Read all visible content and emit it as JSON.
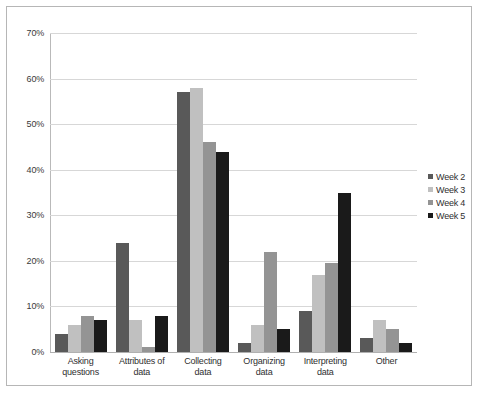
{
  "chart_data": {
    "type": "bar",
    "title": "",
    "xlabel": "",
    "ylabel": "",
    "ylim": [
      0,
      70
    ],
    "ytick_labels": [
      "70%",
      "60%",
      "50%",
      "40%",
      "30%",
      "20%",
      "10%",
      "0%"
    ],
    "ytick_values": [
      70,
      60,
      50,
      40,
      30,
      20,
      10,
      0
    ],
    "grid": true,
    "legend_position": "right",
    "categories": [
      "Asking questions",
      "Attributes of data",
      "Collecting data",
      "Organizing data",
      "Interpreting data",
      "Other"
    ],
    "category_lines": [
      [
        "Asking",
        "questions"
      ],
      [
        "Attributes of",
        "data"
      ],
      [
        "Collecting",
        "data"
      ],
      [
        "Organizing",
        "data"
      ],
      [
        "Interpreting",
        "data"
      ],
      [
        "Other",
        ""
      ]
    ],
    "series": [
      {
        "name": "Week 2",
        "color": "#595959",
        "values": [
          4,
          24,
          57,
          2,
          9,
          3
        ]
      },
      {
        "name": "Week 3",
        "color": "#c0c0c0",
        "values": [
          6,
          7,
          58,
          6,
          17,
          7
        ]
      },
      {
        "name": "Week 4",
        "color": "#949494",
        "values": [
          8,
          1,
          46,
          22,
          19.5,
          5
        ]
      },
      {
        "name": "Week 5",
        "color": "#1a1a1a",
        "values": [
          7,
          8,
          44,
          5,
          35,
          2
        ]
      }
    ]
  },
  "colors": {
    "gridline": "#d7d7d7",
    "axis": "#b9b9b9",
    "border": "#b6b6b6",
    "background": "#ffffff"
  }
}
